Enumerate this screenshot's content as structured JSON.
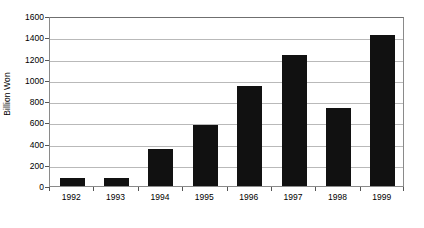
{
  "chart_data": {
    "type": "bar",
    "title": "",
    "subtitle": "",
    "xlabel": "",
    "ylabel": "Billion Won",
    "categories": [
      "1992",
      "1993",
      "1994",
      "1995",
      "1996",
      "1997",
      "1998",
      "1999"
    ],
    "values": [
      80,
      80,
      345,
      570,
      945,
      1230,
      730,
      1420
    ],
    "series": [
      {
        "name": "Billion Won",
        "values": [
          80,
          80,
          345,
          570,
          945,
          1230,
          730,
          1420
        ],
        "color": "#111111"
      }
    ],
    "ylim": [
      0,
      1600
    ],
    "ytick_values": [
      0,
      200,
      400,
      600,
      800,
      1000,
      1200,
      1400,
      1600
    ],
    "ytick_labels": [
      "0",
      "200",
      "400",
      "600",
      "800",
      "1000",
      "1200",
      "1400",
      "1600"
    ],
    "grid": "horizontal",
    "grid_color": "#b9b9b9",
    "legend": "none",
    "legend_position": "none",
    "plot_border_color": "#8a8a8a",
    "background_color": "#ffffff",
    "annotations": []
  }
}
